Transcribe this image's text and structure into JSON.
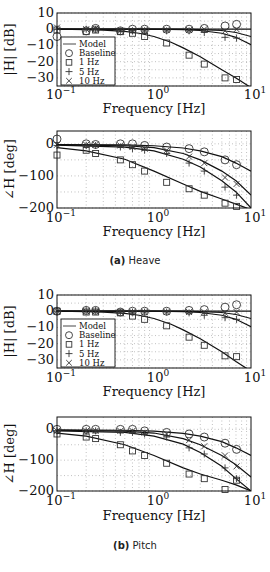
{
  "figure": {
    "captions": [
      {
        "label": "(a)",
        "text": "Heave"
      },
      {
        "label": "(b)",
        "text": "Pitch"
      }
    ]
  },
  "chart_data": [
    {
      "type": "line",
      "panel": "Heave magnitude",
      "xlabel": "Frequency [Hz]",
      "ylabel": "|H| [dB]",
      "xscale": "log",
      "xlim": [
        0.1,
        10
      ],
      "ylim": [
        -35,
        10
      ],
      "xticks": [
        "10^-1",
        "10^0",
        "10^1"
      ],
      "yticks": [
        10,
        0,
        -10,
        -20,
        -30
      ],
      "grid": true,
      "legend": {
        "position": "lower left",
        "entries": [
          "Model",
          "Baseline",
          "1 Hz",
          "5 Hz",
          "10 Hz"
        ]
      },
      "x": [
        0.1,
        0.2,
        0.25,
        0.45,
        0.6,
        0.8,
        1.35,
        2.3,
        3.3,
        5.4,
        7.1
      ],
      "series": [
        {
          "name": "Model (1 Hz)",
          "marker": "line",
          "x": [
            0.1,
            0.2,
            0.3,
            0.5,
            0.7,
            1,
            1.5,
            2,
            3,
            5,
            7,
            10
          ],
          "values": [
            0,
            -0.2,
            -0.5,
            -1.3,
            -2.5,
            -4.5,
            -8,
            -11.5,
            -17,
            -25,
            -30,
            -36
          ]
        },
        {
          "name": "Model (5 Hz)",
          "marker": "line",
          "x": [
            0.1,
            1,
            2,
            3,
            5,
            7,
            10
          ],
          "values": [
            0,
            0,
            -0.3,
            -0.8,
            -2.5,
            -5,
            -9.5
          ]
        },
        {
          "name": "Model (10 Hz)",
          "marker": "line",
          "x": [
            0.1,
            1,
            2,
            3,
            5,
            7,
            10
          ],
          "values": [
            0,
            0,
            0,
            -0.2,
            -0.8,
            -2,
            -4.5
          ]
        },
        {
          "name": "Model (Baseline)",
          "marker": "line",
          "x": [
            0.1,
            10
          ],
          "values": [
            0,
            0
          ]
        },
        {
          "name": "Baseline",
          "marker": "circle",
          "values": [
            -4.5,
            -1,
            0.5,
            -1,
            0,
            0,
            0,
            0,
            0.5,
            2,
            3
          ]
        },
        {
          "name": "1 Hz",
          "marker": "square",
          "values": [
            -0.5,
            -1.5,
            -0.5,
            -1.5,
            -2.5,
            -4.5,
            -8.5,
            -16,
            -21.5,
            -30,
            -31
          ]
        },
        {
          "name": "5 Hz",
          "marker": "plus",
          "values": [
            0,
            0,
            0,
            -1,
            -1,
            -1,
            -1,
            -1,
            -2,
            -5,
            -5.5
          ]
        },
        {
          "name": "10 Hz",
          "marker": "x",
          "values": [
            1,
            0,
            0.5,
            -1,
            -1,
            -0.5,
            -0.5,
            -0.5,
            0,
            -1,
            0
          ]
        }
      ]
    },
    {
      "type": "line",
      "panel": "Heave phase",
      "xlabel": "Frequency [Hz]",
      "ylabel": "∠H [deg]",
      "xscale": "log",
      "xlim": [
        0.1,
        10
      ],
      "ylim": [
        -200,
        40
      ],
      "xticks": [
        "10^-1",
        "10^0",
        "10^1"
      ],
      "yticks": [
        0,
        -100,
        -200
      ],
      "grid": true,
      "x": [
        0.1,
        0.2,
        0.25,
        0.45,
        0.6,
        0.8,
        1.35,
        2.3,
        3.3,
        5.4,
        7.1
      ],
      "series": [
        {
          "name": "Model (Baseline)",
          "marker": "line",
          "x": [
            0.1,
            0.5,
            1,
            2,
            3,
            5,
            7,
            10
          ],
          "values": [
            -2,
            -3,
            -6,
            -13,
            -22,
            -40,
            -60,
            -85
          ]
        },
        {
          "name": "Model (10 Hz)",
          "marker": "line",
          "x": [
            0.1,
            0.5,
            1,
            2,
            3,
            5,
            7,
            10
          ],
          "values": [
            -3,
            -6,
            -12,
            -30,
            -50,
            -85,
            -115,
            -160
          ]
        },
        {
          "name": "Model (5 Hz)",
          "marker": "line",
          "x": [
            0.1,
            0.5,
            1,
            2,
            3,
            5,
            7,
            10
          ],
          "values": [
            -4,
            -10,
            -22,
            -48,
            -72,
            -115,
            -150,
            -200
          ]
        },
        {
          "name": "Model (1 Hz)",
          "marker": "line",
          "x": [
            0.1,
            0.2,
            0.5,
            1,
            2,
            3,
            5,
            7,
            10
          ],
          "values": [
            -12,
            -22,
            -48,
            -85,
            -125,
            -148,
            -172,
            -188,
            -205
          ]
        },
        {
          "name": "Baseline",
          "marker": "circle",
          "values": [
            15,
            0,
            -2,
            0,
            0,
            -5,
            -10,
            -15,
            -25,
            -50,
            -65
          ]
        },
        {
          "name": "1 Hz",
          "marker": "square",
          "values": [
            -35,
            -20,
            -30,
            -50,
            -65,
            -85,
            -120,
            -140,
            -160,
            -185,
            -195
          ]
        },
        {
          "name": "5 Hz",
          "marker": "plus",
          "values": [
            -5,
            -5,
            -5,
            -10,
            -15,
            -20,
            -30,
            -60,
            -85,
            -135,
            -160
          ]
        },
        {
          "name": "10 Hz",
          "marker": "x",
          "values": [
            -3,
            -3,
            -3,
            -5,
            -10,
            -15,
            -20,
            -40,
            -60,
            -105,
            -125
          ]
        }
      ]
    },
    {
      "type": "line",
      "panel": "Pitch magnitude",
      "xlabel": "Frequency [Hz]",
      "ylabel": "|H| [dB]",
      "xscale": "log",
      "xlim": [
        0.1,
        10
      ],
      "ylim": [
        -35,
        10
      ],
      "xticks": [
        "10^-1",
        "10^0",
        "10^1"
      ],
      "yticks": [
        10,
        0,
        -10,
        -20,
        -30
      ],
      "grid": true,
      "legend": {
        "position": "lower left",
        "entries": [
          "Model",
          "Baseline",
          "1 Hz",
          "5 Hz",
          "10 Hz"
        ]
      },
      "x": [
        0.1,
        0.2,
        0.25,
        0.45,
        0.6,
        0.8,
        1.35,
        2.3,
        3.3,
        5.4,
        7.1
      ],
      "series": [
        {
          "name": "Model (1 Hz)",
          "marker": "line",
          "x": [
            0.1,
            0.2,
            0.3,
            0.5,
            0.7,
            1,
            1.5,
            2,
            3,
            5,
            7,
            10
          ],
          "values": [
            0,
            -0.2,
            -0.5,
            -1.3,
            -2.5,
            -4.5,
            -8,
            -11.5,
            -17,
            -25,
            -31,
            -37
          ]
        },
        {
          "name": "Model (5 Hz)",
          "marker": "line",
          "x": [
            0.1,
            1,
            2,
            3,
            5,
            7,
            10
          ],
          "values": [
            0,
            0,
            -0.3,
            -0.8,
            -2.5,
            -5,
            -9.5
          ]
        },
        {
          "name": "Model (10 Hz)",
          "marker": "line",
          "x": [
            0.1,
            1,
            2,
            3,
            5,
            7,
            10
          ],
          "values": [
            0,
            0,
            0,
            -0.2,
            -0.8,
            -2,
            -4.5
          ]
        },
        {
          "name": "Model (Baseline)",
          "marker": "line",
          "x": [
            0.1,
            10
          ],
          "values": [
            0,
            0
          ]
        },
        {
          "name": "Baseline",
          "marker": "circle",
          "values": [
            0,
            0.5,
            0.5,
            -0.5,
            0,
            0,
            0,
            0.5,
            1,
            2.5,
            4
          ]
        },
        {
          "name": "1 Hz",
          "marker": "square",
          "values": [
            0,
            -0.5,
            -0.5,
            -1,
            -3,
            -5,
            -9,
            -16,
            -21,
            -27.5,
            -28
          ]
        },
        {
          "name": "5 Hz",
          "marker": "plus",
          "values": [
            0,
            0.5,
            0.5,
            -0.5,
            -0.5,
            -0.5,
            -0.5,
            -1,
            -2.5,
            -4,
            -5
          ]
        },
        {
          "name": "10 Hz",
          "marker": "x",
          "values": [
            0,
            0,
            0,
            -0.5,
            -0.5,
            -0.5,
            -0.5,
            -0.5,
            -0.5,
            -1,
            -0.5
          ]
        }
      ]
    },
    {
      "type": "line",
      "panel": "Pitch phase",
      "xlabel": "Frequency [Hz]",
      "ylabel": "∠H [deg]",
      "xscale": "log",
      "xlim": [
        0.1,
        10
      ],
      "ylim": [
        -200,
        40
      ],
      "xticks": [
        "10^-1",
        "10^0",
        "10^1"
      ],
      "yticks": [
        0,
        -100,
        -200
      ],
      "grid": true,
      "x": [
        0.1,
        0.2,
        0.25,
        0.45,
        0.6,
        0.8,
        1.35,
        2.3,
        3.3,
        5.4,
        7.1
      ],
      "series": [
        {
          "name": "Model (Baseline)",
          "marker": "line",
          "x": [
            0.1,
            0.5,
            1,
            2,
            3,
            5,
            7,
            10
          ],
          "values": [
            -2,
            -3,
            -6,
            -13,
            -22,
            -40,
            -60,
            -85
          ]
        },
        {
          "name": "Model (10 Hz)",
          "marker": "line",
          "x": [
            0.1,
            0.5,
            1,
            2,
            3,
            5,
            7,
            10
          ],
          "values": [
            -3,
            -6,
            -12,
            -30,
            -50,
            -85,
            -115,
            -155
          ]
        },
        {
          "name": "Model (5 Hz)",
          "marker": "line",
          "x": [
            0.1,
            0.5,
            1,
            2,
            3,
            5,
            7,
            10
          ],
          "values": [
            -5,
            -10,
            -22,
            -48,
            -75,
            -120,
            -160,
            -200
          ]
        },
        {
          "name": "Model (1 Hz)",
          "marker": "line",
          "x": [
            0.1,
            0.2,
            0.5,
            1,
            2,
            3,
            5,
            7,
            10
          ],
          "values": [
            -12,
            -22,
            -50,
            -85,
            -125,
            -145,
            -165,
            -180,
            -200
          ]
        },
        {
          "name": "Baseline",
          "marker": "circle",
          "values": [
            0,
            0,
            0,
            0,
            0,
            -5,
            -10,
            -15,
            -25,
            -45,
            -65
          ]
        },
        {
          "name": "1 Hz",
          "marker": "square",
          "values": [
            -15,
            -25,
            -30,
            -50,
            -70,
            -85,
            -110,
            -145,
            -160,
            -195,
            -165
          ]
        },
        {
          "name": "5 Hz",
          "marker": "plus",
          "values": [
            -5,
            -5,
            -5,
            -10,
            -10,
            -15,
            -25,
            -60,
            -80,
            -125,
            -160
          ]
        },
        {
          "name": "10 Hz",
          "marker": "x",
          "values": [
            -5,
            -5,
            -5,
            -5,
            -5,
            -10,
            -15,
            -35,
            -55,
            -85,
            -120
          ]
        }
      ]
    }
  ]
}
